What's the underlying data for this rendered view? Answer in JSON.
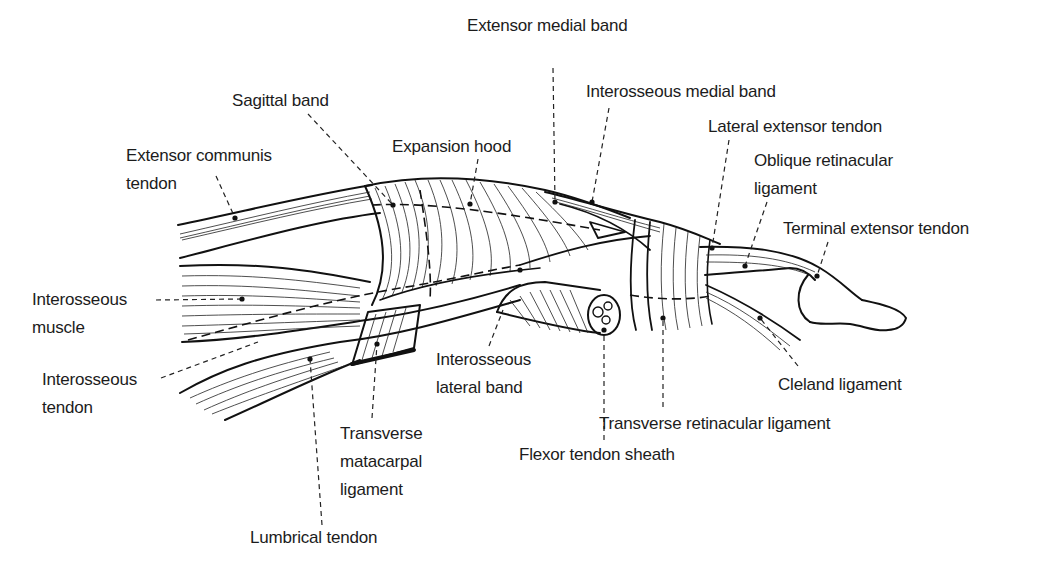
{
  "diagram": {
    "title": "",
    "colors": {
      "ink": "#111111",
      "background": "#ffffff",
      "label_text": "#1c1c1c"
    },
    "labels": [
      {
        "id": "extensor-medial-band",
        "lines": [
          "Extensor medial band"
        ],
        "x": 467,
        "y": 12,
        "anchor": [
          555,
          202
        ]
      },
      {
        "id": "interosseous-medial-band",
        "lines": [
          "Interosseous medial band"
        ],
        "x": 586,
        "y": 78,
        "anchor": [
          592,
          202
        ]
      },
      {
        "id": "sagittal-band",
        "lines": [
          "Sagittal band"
        ],
        "x": 232,
        "y": 87,
        "anchor": [
          393,
          205
        ]
      },
      {
        "id": "lateral-extensor-tendon",
        "lines": [
          "Lateral extensor tendon"
        ],
        "x": 708,
        "y": 113,
        "anchor": [
          712,
          248
        ]
      },
      {
        "id": "expansion-hood",
        "lines": [
          "Expansion hood"
        ],
        "x": 392,
        "y": 133,
        "anchor": [
          470,
          204
        ]
      },
      {
        "id": "oblique-retinacular-ligament",
        "lines": [
          "Oblique retinacular",
          "ligament"
        ],
        "x": 754,
        "y": 147,
        "anchor": [
          745,
          266
        ]
      },
      {
        "id": "extensor-communis-tendon",
        "lines": [
          "Extensor communis",
          "tendon"
        ],
        "x": 126,
        "y": 142,
        "anchor": [
          235,
          218
        ]
      },
      {
        "id": "terminal-extensor-tendon",
        "lines": [
          "Terminal extensor tendon"
        ],
        "x": 783,
        "y": 215,
        "anchor": [
          817,
          276
        ]
      },
      {
        "id": "interosseous-muscle",
        "lines": [
          "Interosseous",
          "muscle"
        ],
        "x": 32,
        "y": 286,
        "anchor": [
          242,
          299
        ]
      },
      {
        "id": "interosseous-tendon",
        "lines": [
          "Interosseous",
          "tendon"
        ],
        "x": 42,
        "y": 366,
        "anchor": [
          258,
          342
        ]
      },
      {
        "id": "interosseous-lateral-band",
        "lines": [
          "Interosseous",
          "lateral band"
        ],
        "x": 436,
        "y": 346,
        "anchor": [
          503,
          310
        ]
      },
      {
        "id": "cleland-ligament",
        "lines": [
          "Cleland ligament"
        ],
        "x": 778,
        "y": 371,
        "anchor": [
          760,
          318
        ]
      },
      {
        "id": "transverse-retinacular-ligament",
        "lines": [
          "Transverse retinacular ligament"
        ],
        "x": 599,
        "y": 410,
        "anchor": [
          663,
          318
        ]
      },
      {
        "id": "transverse-metacarpal-ligament",
        "lines": [
          "Transverse",
          "matacarpal",
          "ligament"
        ],
        "x": 340,
        "y": 420,
        "anchor": [
          377,
          344
        ]
      },
      {
        "id": "flexor-tendon-sheath",
        "lines": [
          "Flexor tendon sheath"
        ],
        "x": 519,
        "y": 441,
        "anchor": [
          604,
          330
        ]
      },
      {
        "id": "lumbrical-tendon",
        "lines": [
          "Lumbrical tendon"
        ],
        "x": 250,
        "y": 524,
        "anchor": [
          310,
          359
        ]
      }
    ],
    "leaders": [
      {
        "id": "extensor-medial-band",
        "points": [
          [
            553,
            68
          ],
          [
            555,
            202
          ]
        ]
      },
      {
        "id": "interosseous-medial-band",
        "points": [
          [
            609,
            108
          ],
          [
            592,
            202
          ]
        ]
      },
      {
        "id": "sagittal-band",
        "points": [
          [
            308,
            114
          ],
          [
            393,
            205
          ]
        ]
      },
      {
        "id": "lateral-extensor-tendon",
        "points": [
          [
            729,
            140
          ],
          [
            712,
            248
          ]
        ]
      },
      {
        "id": "expansion-hood",
        "points": [
          [
            478,
            159
          ],
          [
            470,
            204
          ]
        ]
      },
      {
        "id": "oblique-retinacular-ligament",
        "points": [
          [
            767,
            202
          ],
          [
            745,
            266
          ]
        ]
      },
      {
        "id": "extensor-communis-tendon",
        "points": [
          [
            216,
            176
          ],
          [
            235,
            218
          ]
        ]
      },
      {
        "id": "terminal-extensor-tendon",
        "points": [
          [
            828,
            242
          ],
          [
            817,
            276
          ]
        ]
      },
      {
        "id": "interosseous-muscle",
        "points": [
          [
            156,
            300
          ],
          [
            242,
            299
          ]
        ]
      },
      {
        "id": "interosseous-tendon",
        "points": [
          [
            161,
            378
          ],
          [
            258,
            342
          ]
        ]
      },
      {
        "id": "interosseous-lateral-band",
        "points": [
          [
            489,
            346
          ],
          [
            503,
            310
          ]
        ]
      },
      {
        "id": "cleland-ligament",
        "points": [
          [
            798,
            366
          ],
          [
            760,
            318
          ]
        ]
      },
      {
        "id": "transverse-retinacular-ligament",
        "points": [
          [
            663,
            407
          ],
          [
            663,
            318
          ]
        ]
      },
      {
        "id": "transverse-metacarpal-ligament",
        "points": [
          [
            372,
            418
          ],
          [
            377,
            344
          ]
        ]
      },
      {
        "id": "flexor-tendon-sheath",
        "points": [
          [
            604,
            440
          ],
          [
            604,
            330
          ]
        ]
      },
      {
        "id": "lumbrical-tendon",
        "points": [
          [
            322,
            525
          ],
          [
            310,
            359
          ]
        ]
      }
    ]
  }
}
